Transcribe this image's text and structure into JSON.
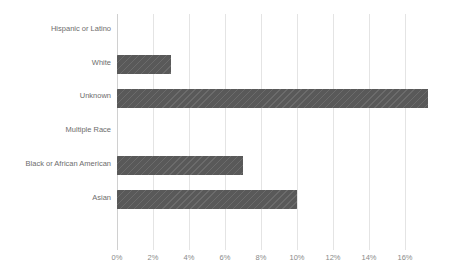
{
  "chart_data": {
    "type": "bar",
    "orientation": "horizontal",
    "title": "",
    "xlabel": "",
    "ylabel": "",
    "categories": [
      "Hispanic or Latino",
      "White",
      "Unknown",
      "Multiple Race",
      "Black or African American",
      "Asian"
    ],
    "values": [
      0,
      3,
      17.3,
      0,
      7,
      10
    ],
    "value_suffix": "%",
    "xlim": [
      0,
      18
    ],
    "xticks": [
      0,
      2,
      4,
      6,
      8,
      10,
      12,
      14,
      16
    ],
    "xtick_labels": [
      "0%",
      "2%",
      "4%",
      "6%",
      "8%",
      "10%",
      "12%",
      "14%",
      "16%"
    ],
    "grid": true,
    "grid_axis": "x",
    "legend": false,
    "legend_position": "none",
    "series": [
      {
        "name": "",
        "values": [
          0,
          3,
          17.3,
          0,
          7,
          10
        ]
      }
    ],
    "bar_color": "#595959",
    "grid_color": "#e4e4e4",
    "axis_color": "#d0d0d0",
    "label_color": "#6d6d6d",
    "tick_label_color": "#8a8a8a"
  },
  "caption": {
    "text": ""
  }
}
